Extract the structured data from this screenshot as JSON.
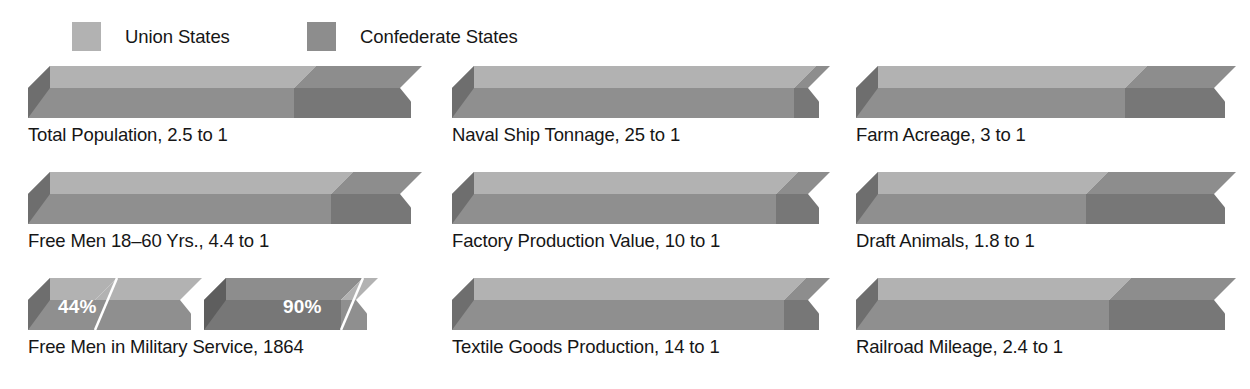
{
  "legend": {
    "items": [
      {
        "label": "Union States",
        "color": "#b2b2b2",
        "key": "union"
      },
      {
        "label": "Confederate States",
        "color": "#8d8d8d",
        "key": "confederate"
      }
    ]
  },
  "colors": {
    "union_top": "#b2b2b2",
    "union_side": "#8f8f8f",
    "union_cap": "#6e6e6e",
    "confederate_top": "#8d8d8d",
    "confederate_side": "#777777",
    "confederate_cap": "#5e5e5e",
    "label_text": "#161616",
    "pct_text": "#ffffff",
    "background": "#ffffff"
  },
  "chart_data": {
    "type": "bar",
    "xlabel": "",
    "ylabel": "",
    "legend": [
      "Union States",
      "Confederate States"
    ],
    "legend_position": "top-left",
    "grid": false,
    "style": "3d-horizontal-stacked-ratio-bars",
    "note": "Each full bar is split proportionally by the stated ratio; left (lighter) segment = Union share, right (darker) segment = Confederate share.",
    "categories": [
      "Total Population, 2.5 to 1",
      "Naval Ship Tonnage, 25 to 1",
      "Farm Acreage, 3 to 1",
      "Free Men 18–60 Yrs., 4.4 to 1",
      "Factory Production Value, 10 to 1",
      "Draft Animals, 1.8 to 1",
      "Free Men in Military Service, 1864",
      "Textile Goods Production, 14 to 1",
      "Railroad Mileage, 2.4 to 1"
    ],
    "bars": [
      {
        "id": "total-population",
        "label": "Total Population, 2.5 to 1",
        "row": 0,
        "col": 0,
        "kind": "ratio",
        "ratio": 2.5,
        "ratio_text": "2.5 to 1",
        "union_share_pct": 71.4,
        "confederate_share_pct": 28.6
      },
      {
        "id": "naval-ship-tonnage",
        "label": "Naval Ship Tonnage, 25 to 1",
        "row": 0,
        "col": 1,
        "kind": "ratio",
        "ratio": 25,
        "ratio_text": "25 to 1",
        "union_share_pct": 96.2,
        "confederate_share_pct": 3.8
      },
      {
        "id": "farm-acreage",
        "label": "Farm Acreage, 3 to 1",
        "row": 0,
        "col": 2,
        "kind": "ratio",
        "ratio": 3,
        "ratio_text": "3 to 1",
        "union_share_pct": 75.0,
        "confederate_share_pct": 25.0
      },
      {
        "id": "free-men-18-60",
        "label": "Free Men 18–60 Yrs., 4.4 to 1",
        "row": 1,
        "col": 0,
        "kind": "ratio",
        "ratio": 4.4,
        "ratio_text": "4.4 to 1",
        "union_share_pct": 81.5,
        "confederate_share_pct": 18.5
      },
      {
        "id": "factory-production-value",
        "label": "Factory Production Value, 10 to 1",
        "row": 1,
        "col": 1,
        "kind": "ratio",
        "ratio": 10,
        "ratio_text": "10 to 1",
        "union_share_pct": 90.9,
        "confederate_share_pct": 9.1
      },
      {
        "id": "draft-animals",
        "label": "Draft Animals, 1.8 to 1",
        "row": 1,
        "col": 2,
        "kind": "ratio",
        "ratio": 1.8,
        "ratio_text": "1.8 to 1",
        "union_share_pct": 64.3,
        "confederate_share_pct": 35.7
      },
      {
        "id": "free-men-military-service",
        "label": "Free Men in Military Service, 1864",
        "row": 2,
        "col": 0,
        "kind": "percent-pair",
        "year": "1864",
        "segments": [
          {
            "series": "Union States",
            "value_text": "44%",
            "value": 44
          },
          {
            "series": "Confederate States",
            "value_text": "90%",
            "value": 90
          }
        ]
      },
      {
        "id": "textile-goods-production",
        "label": "Textile Goods Production, 14 to 1",
        "row": 2,
        "col": 1,
        "kind": "ratio",
        "ratio": 14,
        "ratio_text": "14 to 1",
        "union_share_pct": 93.3,
        "confederate_share_pct": 6.7
      },
      {
        "id": "railroad-mileage",
        "label": "Railroad Mileage, 2.4 to 1",
        "row": 2,
        "col": 2,
        "kind": "ratio",
        "ratio": 2.4,
        "ratio_text": "2.4 to 1",
        "union_share_pct": 70.6,
        "confederate_share_pct": 29.4
      }
    ]
  }
}
